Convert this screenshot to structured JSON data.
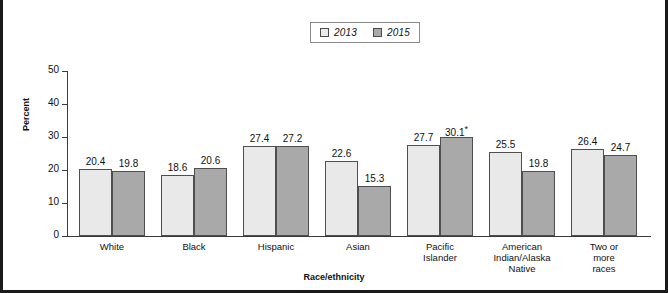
{
  "chart_data": {
    "type": "bar",
    "title": "",
    "xlabel": "Race/ethnicity",
    "ylabel": "Percent",
    "ylim": [
      0,
      50
    ],
    "yticks": [
      0,
      10,
      20,
      30,
      40,
      50
    ],
    "ytick_labels": [
      "0",
      "10",
      "20",
      "30",
      "40",
      "50"
    ],
    "grid": false,
    "legend_position": "top-center",
    "categories": [
      "White",
      "Black",
      "Hispanic",
      "Asian",
      "Pacific\nIslander",
      "American\nIndian/Alaska\nNative",
      "Two or\nmore races"
    ],
    "series": [
      {
        "name": "2013",
        "color": "#e9e9e9",
        "values": [
          20.4,
          18.6,
          27.4,
          22.6,
          27.7,
          25.5,
          26.4
        ],
        "labels": [
          "20.4",
          "18.6",
          "27.4",
          "22.6",
          "27.7",
          "25.5",
          "26.4"
        ]
      },
      {
        "name": "2015",
        "color": "#a9a9a9",
        "values": [
          19.8,
          20.6,
          27.2,
          15.3,
          30.1,
          19.8,
          24.7
        ],
        "labels": [
          "19.8",
          "20.6",
          "27.2",
          "15.3",
          "30.1*",
          "19.8",
          "24.7"
        ]
      }
    ],
    "annotations": [
      "*"
    ]
  },
  "legend": {
    "items": [
      {
        "label": "2013",
        "swatch": "light-swatch"
      },
      {
        "label": "2015",
        "swatch": "dark-swatch"
      }
    ]
  }
}
